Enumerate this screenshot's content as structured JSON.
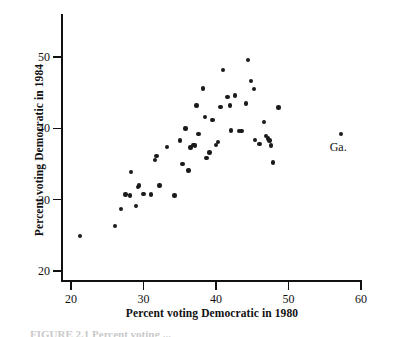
{
  "figure": {
    "caption_partial": "FIGURE 2.1  Percent voting ..."
  },
  "annotation": {
    "ga_label": "Ga."
  },
  "chart_data": {
    "type": "scatter",
    "title": "",
    "xlabel": "Percent voting Democratic in 1980",
    "ylabel": "Percent voting Democratic in 1984",
    "xlim": [
      19,
      60.5
    ],
    "ylim": [
      18.5,
      53
    ],
    "xticks": [
      20,
      30,
      40,
      50,
      60
    ],
    "yticks": [
      20,
      30,
      40,
      50
    ],
    "xtick_labels": [
      "20",
      "30",
      "40",
      "50",
      "60"
    ],
    "ytick_labels": [
      "20",
      "30",
      "40",
      "50"
    ],
    "grid": false,
    "legend": false,
    "points": [
      {
        "x": 21.2,
        "y": 24.9
      },
      {
        "x": 26.1,
        "y": 26.3
      },
      {
        "x": 26.9,
        "y": 28.7
      },
      {
        "x": 27.5,
        "y": 30.7
      },
      {
        "x": 28.1,
        "y": 30.6
      },
      {
        "x": 28.3,
        "y": 33.9
      },
      {
        "x": 29.0,
        "y": 29.1
      },
      {
        "x": 29.2,
        "y": 31.8
      },
      {
        "x": 29.4,
        "y": 32.0
      },
      {
        "x": 30.0,
        "y": 30.8
      },
      {
        "x": 31.0,
        "y": 30.7
      },
      {
        "x": 31.6,
        "y": 35.6
      },
      {
        "x": 31.8,
        "y": 36.1
      },
      {
        "x": 32.2,
        "y": 32.0
      },
      {
        "x": 33.2,
        "y": 37.4
      },
      {
        "x": 34.3,
        "y": 30.6
      },
      {
        "x": 35.0,
        "y": 38.3
      },
      {
        "x": 35.4,
        "y": 35.0
      },
      {
        "x": 35.8,
        "y": 40.0
      },
      {
        "x": 36.2,
        "y": 34.1
      },
      {
        "x": 36.5,
        "y": 37.3
      },
      {
        "x": 36.9,
        "y": 37.7
      },
      {
        "x": 37.1,
        "y": 37.6
      },
      {
        "x": 37.3,
        "y": 43.2
      },
      {
        "x": 37.6,
        "y": 39.2
      },
      {
        "x": 38.2,
        "y": 45.6
      },
      {
        "x": 38.5,
        "y": 41.6
      },
      {
        "x": 38.7,
        "y": 35.8
      },
      {
        "x": 39.1,
        "y": 36.6
      },
      {
        "x": 39.5,
        "y": 41.2
      },
      {
        "x": 40.0,
        "y": 37.7
      },
      {
        "x": 40.3,
        "y": 38.1
      },
      {
        "x": 40.6,
        "y": 43.0
      },
      {
        "x": 41.0,
        "y": 48.2
      },
      {
        "x": 41.6,
        "y": 44.4
      },
      {
        "x": 41.9,
        "y": 43.2
      },
      {
        "x": 42.1,
        "y": 39.7
      },
      {
        "x": 42.6,
        "y": 44.6
      },
      {
        "x": 43.2,
        "y": 39.6
      },
      {
        "x": 43.5,
        "y": 39.6
      },
      {
        "x": 44.1,
        "y": 43.5
      },
      {
        "x": 44.4,
        "y": 49.6
      },
      {
        "x": 44.8,
        "y": 46.6
      },
      {
        "x": 45.2,
        "y": 45.5
      },
      {
        "x": 45.4,
        "y": 38.4
      },
      {
        "x": 46.0,
        "y": 37.8
      },
      {
        "x": 46.6,
        "y": 40.9
      },
      {
        "x": 46.9,
        "y": 38.9
      },
      {
        "x": 47.2,
        "y": 38.6
      },
      {
        "x": 47.4,
        "y": 38.3
      },
      {
        "x": 47.6,
        "y": 37.6
      },
      {
        "x": 47.9,
        "y": 35.2
      },
      {
        "x": 48.6,
        "y": 42.9
      },
      {
        "x": 57.2,
        "y": 39.2
      }
    ],
    "highlight_point": {
      "x": 57.2,
      "y": 39.2,
      "label": "Ga."
    }
  }
}
